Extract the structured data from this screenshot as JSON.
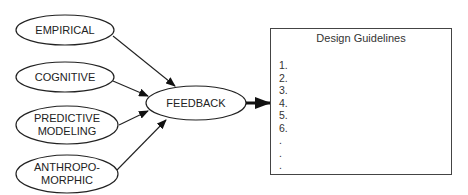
{
  "inputs": [
    {
      "id": "empirical",
      "lines": [
        "EMPIRICAL"
      ]
    },
    {
      "id": "cognitive",
      "lines": [
        "COGNITIVE"
      ]
    },
    {
      "id": "predictive-modeling",
      "lines": [
        "PREDICTIVE",
        "MODELING"
      ]
    },
    {
      "id": "anthropomorphic",
      "lines": [
        "ANTHROPO-",
        "MORPHIC"
      ]
    }
  ],
  "hub": {
    "label": "FEEDBACK"
  },
  "output": {
    "title": "Design Guidelines",
    "items": [
      "1.",
      "2.",
      "3.",
      "4.",
      "5.",
      "6.",
      ".",
      ".",
      "."
    ]
  },
  "colors": {
    "stroke": "#222222",
    "background": "#ffffff"
  }
}
